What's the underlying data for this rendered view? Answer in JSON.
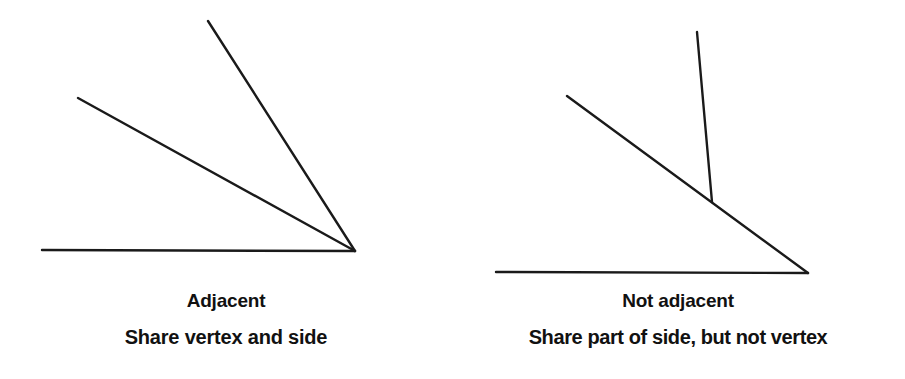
{
  "canvas": {
    "width": 905,
    "height": 379,
    "background": "#ffffff",
    "stroke_color": "#1a1a1a",
    "stroke_width": 2.4
  },
  "figures": [
    {
      "id": "adjacent",
      "title": "Adjacent",
      "subtitle": "Share vertex and side",
      "description": "Two angles sharing a common vertex and a common side",
      "geometry": {
        "vertex": {
          "x": 355,
          "y": 251
        },
        "rays": [
          {
            "name": "horizontal-ray",
            "x1": 42,
            "y1": 250,
            "x2": 355,
            "y2": 251
          },
          {
            "name": "middle-ray",
            "x1": 78,
            "y1": 98,
            "x2": 355,
            "y2": 251
          },
          {
            "name": "steep-ray",
            "x1": 208,
            "y1": 21,
            "x2": 355,
            "y2": 251
          }
        ]
      }
    },
    {
      "id": "not-adjacent",
      "title": "Not adjacent",
      "subtitle": "Share part of side, but not vertex",
      "description": "Two angles sharing part of a side but having different vertices",
      "geometry": {
        "vertex": {
          "x": 808,
          "y": 273
        },
        "junction": {
          "x": 712,
          "y": 202
        },
        "rays": [
          {
            "name": "horizontal-ray",
            "x1": 496,
            "y1": 272,
            "x2": 808,
            "y2": 273
          },
          {
            "name": "diagonal-ray",
            "x1": 567,
            "y1": 96,
            "x2": 808,
            "y2": 273
          },
          {
            "name": "vertical-ray",
            "x1": 697,
            "y1": 32,
            "x2": 712,
            "y2": 202
          }
        ]
      }
    }
  ]
}
